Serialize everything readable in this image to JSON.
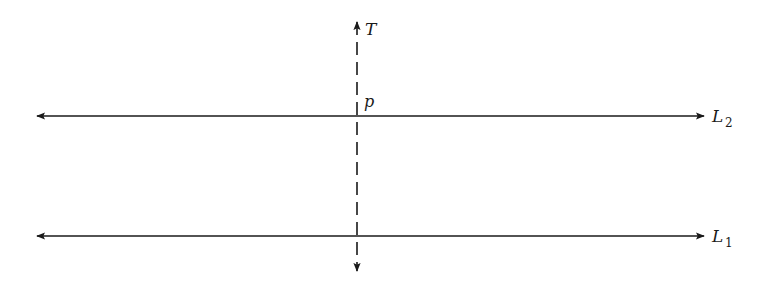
{
  "diagram": {
    "type": "geometry-lines",
    "colors": {
      "line": "#1a1a1a",
      "background": "#ffffff"
    },
    "lines": [
      {
        "id": "L2",
        "name": "L",
        "subscript": "2",
        "y": 116,
        "x_start": 35,
        "x_end": 705,
        "style": "solid",
        "arrows": "both"
      },
      {
        "id": "L1",
        "name": "L",
        "subscript": "1",
        "y": 236,
        "x_start": 35,
        "x_end": 705,
        "style": "solid",
        "arrows": "both"
      }
    ],
    "transversal": {
      "id": "T",
      "label": "T",
      "x": 357,
      "y_start": 20,
      "y_end": 272,
      "style": "dashed",
      "arrows": "both"
    },
    "points": [
      {
        "id": "p",
        "label": "p",
        "x": 357,
        "y": 116
      }
    ]
  }
}
